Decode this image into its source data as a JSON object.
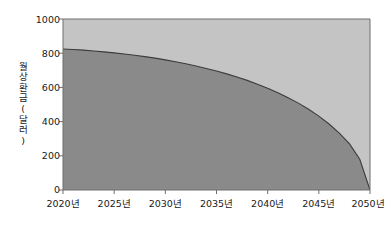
{
  "chart_data": {
    "type": "area",
    "title": "",
    "subtitle": "",
    "xlabel": "",
    "ylabel": "월 상환금(달러)",
    "ylabel_chars": [
      "월",
      "상",
      "환",
      "금",
      "(",
      "달",
      "러",
      ")"
    ],
    "xlim": [
      2020,
      2050
    ],
    "ylim": [
      0,
      1000
    ],
    "grid": false,
    "legend": null,
    "x_tick_labels": [
      "2020년",
      "2025년",
      "2030년",
      "2035년",
      "2040년",
      "2045년",
      "2050년"
    ],
    "x_ticks": [
      2020,
      2025,
      2030,
      2035,
      2040,
      2045,
      2050
    ],
    "y_tick_labels": [
      "0",
      "200",
      "400",
      "600",
      "800",
      "1000"
    ],
    "y_ticks": [
      0,
      200,
      400,
      600,
      800,
      1000
    ],
    "series": [
      {
        "name": "월 상환금",
        "fill_color": "#8a8a8a",
        "line_color": "#3b3b3b",
        "x": [
          2020,
          2021,
          2022,
          2023,
          2024,
          2025,
          2026,
          2027,
          2028,
          2029,
          2030,
          2031,
          2032,
          2033,
          2034,
          2035,
          2036,
          2037,
          2038,
          2039,
          2040,
          2041,
          2042,
          2043,
          2044,
          2045,
          2046,
          2047,
          2048,
          2049,
          2050
        ],
        "values": [
          825,
          822,
          818,
          813,
          808,
          802,
          795,
          788,
          780,
          771,
          761,
          750,
          738,
          725,
          711,
          696,
          679,
          661,
          641,
          619,
          595,
          569,
          540,
          508,
          472,
          432,
          386,
          333,
          270,
          180,
          0
        ]
      }
    ],
    "background_series": {
      "name": "배경 영역",
      "fill_color": "#c4c4c4",
      "value": 1000
    },
    "colors": {
      "plot_background": "#c4c4c4",
      "area_fill": "#8a8a8a",
      "curve_line": "#3b3b3b",
      "axis": "#6f6f6f",
      "text": "#1a1a1a",
      "page_background": "#ffffff"
    }
  }
}
